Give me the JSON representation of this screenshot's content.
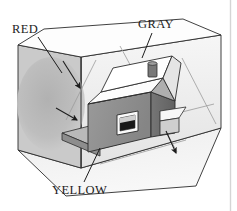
{
  "figure": {
    "medium": "pencil sketch",
    "background_color": "#ffffff",
    "ink_color": "#1d1d1d"
  },
  "labels": [
    {
      "id": "red",
      "text": "RED",
      "refers_to": "left interior wall of the room box",
      "x": 12,
      "y": 23,
      "leader": {
        "from": [
          38,
          36
        ],
        "to": [
          63,
          72
        ]
      }
    },
    {
      "id": "gray",
      "text": "GRAY",
      "refers_to": "back interior wall of the room box",
      "x": 138,
      "y": 18,
      "leader": {
        "from": [
          152,
          32
        ],
        "to": [
          142,
          58
        ]
      }
    },
    {
      "id": "yellow",
      "text": "YELLOW",
      "refers_to": "floor of the room box",
      "x": 52,
      "y": 184,
      "leader": {
        "from": [
          84,
          183
        ],
        "to": [
          99,
          149
        ]
      }
    }
  ],
  "room_box": {
    "description": "Three-sided open box: left wall, back wall, floor",
    "left_wall": {
      "name": "red-wall",
      "fill": "#c9c9c9",
      "points": "18,45 18,150 81,168 81,57",
      "shading_blob": {
        "cx": 52,
        "cy": 104,
        "rx": 34,
        "ry": 46,
        "fill": "#b6b6b6"
      }
    },
    "back_wall": {
      "name": "gray-wall",
      "fill": "#ededed",
      "points": "81,57 221,35 221,128 81,168"
    },
    "floor": {
      "name": "yellow-floor",
      "fill": "#f2f2f2",
      "points": "18,150 81,168 221,128 196,186 66,196"
    },
    "ceiling_edge": {
      "name": "ceiling-edge",
      "points": "18,45 81,57 221,35 183,19 44,29"
    }
  },
  "house": {
    "name": "house-model",
    "front_wall": {
      "fill": "#8f8f8f"
    },
    "side_wall": {
      "fill": "#6e6e6e"
    },
    "roof_left": {
      "fill": "#fbfbfb"
    },
    "roof_right": {
      "fill": "#e2e2e2"
    },
    "gable": {
      "fill": "#a8a8a8"
    },
    "chimney": {
      "fill": "#7a7a7a"
    },
    "window": {
      "frame_fill": "#fafafa",
      "pane_fill": "#1a1a1a"
    },
    "porch_roof": {
      "fill": "#f4f4f4"
    },
    "base_slab": {
      "fill": "#a5a5a5"
    }
  },
  "annotations": {
    "arrows": [
      {
        "id": "arrow-left-wall",
        "from": [
          64,
          62
        ],
        "to": [
          80,
          88
        ],
        "note": "points to left wall surface"
      },
      {
        "id": "arrow-floor-left",
        "from": [
          58,
          110
        ],
        "to": [
          78,
          120
        ],
        "note": "points toward floor near house"
      },
      {
        "id": "arrow-floor-right",
        "from": [
          166,
          132
        ],
        "to": [
          176,
          152
        ],
        "note": "points down to floor on right"
      }
    ],
    "construction_lines": [
      {
        "id": "light-ray-1",
        "from": [
          120,
          48
        ],
        "to": [
          176,
          150
        ]
      },
      {
        "id": "light-ray-2",
        "from": [
          181,
          60
        ],
        "to": [
          215,
          122
        ]
      },
      {
        "id": "light-ray-3",
        "from": [
          84,
          50
        ],
        "to": [
          84,
          166
        ]
      }
    ]
  },
  "border": {
    "right_rule": {
      "x": 230,
      "color": "#d5d5d5"
    }
  }
}
